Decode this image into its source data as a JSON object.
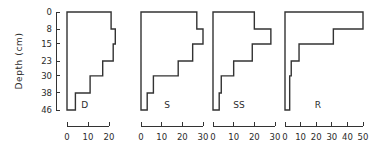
{
  "chart_data": {
    "type": "bar",
    "orientation": "horizontal-step-profile",
    "title": "",
    "subtitle": "",
    "xlabel": "",
    "ylabel": "Depth  (cm)",
    "grid": false,
    "legend": "none",
    "y_axis": {
      "label": "Depth  (cm)",
      "unit": "cm",
      "direction": "inverted",
      "ticks": [
        0,
        8,
        15,
        23,
        30,
        38,
        46
      ],
      "tick_labels": [
        "0",
        "8",
        "15",
        "23",
        "30",
        "38",
        "46"
      ],
      "ylim": [
        0,
        46
      ]
    },
    "depth_bands": [
      {
        "top": 0,
        "bottom": 8
      },
      {
        "top": 8,
        "bottom": 15
      },
      {
        "top": 15,
        "bottom": 23
      },
      {
        "top": 23,
        "bottom": 30
      },
      {
        "top": 30,
        "bottom": 38
      },
      {
        "top": 38,
        "bottom": 46
      }
    ],
    "panels": [
      {
        "label": "D",
        "xlim": [
          0,
          20
        ],
        "xticks": [
          0,
          10,
          20
        ],
        "xtick_labels": [
          "0",
          "10",
          "20"
        ],
        "values": [
          21,
          23,
          22,
          17,
          11,
          4
        ]
      },
      {
        "label": "S",
        "xlim": [
          0,
          30
        ],
        "xticks": [
          0,
          10,
          20,
          30
        ],
        "xtick_labels": [
          "0",
          "10",
          "20",
          "30"
        ],
        "values": [
          27,
          30,
          25,
          18,
          6,
          3
        ]
      },
      {
        "label": "SS",
        "xlim": [
          0,
          30
        ],
        "xticks": [
          0,
          10,
          20,
          30
        ],
        "xtick_labels": [
          "0",
          "10",
          "20",
          "30"
        ],
        "values": [
          20,
          28,
          19,
          10,
          4,
          3
        ]
      },
      {
        "label": "R",
        "xlim": [
          0,
          50
        ],
        "xticks": [
          0,
          10,
          20,
          30,
          40,
          50
        ],
        "xtick_labels": [
          "0",
          "10",
          "20",
          "30",
          "40",
          "50"
        ],
        "values": [
          50,
          31,
          9,
          4,
          3,
          3
        ]
      }
    ]
  }
}
